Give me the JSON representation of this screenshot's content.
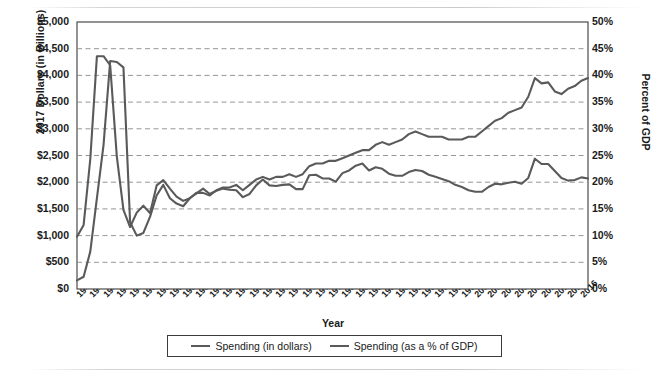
{
  "chart_data": {
    "type": "line",
    "title": "",
    "xlabel": "Year",
    "ylabel": "2017 Dollars (in Billions)",
    "y2label": "Percent of GDP",
    "grid": true,
    "legend_position": "bottom",
    "xlim": [
      1940,
      2017
    ],
    "ylim": [
      0,
      5000
    ],
    "y2lim": [
      0,
      50
    ],
    "x_tick_labels": [
      "1940",
      "1942",
      "1944",
      "1946",
      "1948",
      "1950",
      "1952",
      "1954",
      "1956",
      "1958",
      "1960",
      "1962",
      "1964",
      "1966",
      "1968",
      "1970",
      "1972",
      "1974",
      "1976",
      "1978",
      "1980",
      "1982",
      "1984",
      "1986",
      "1988",
      "1990",
      "1992",
      "1994",
      "1996",
      "1998",
      "2000",
      "2002",
      "2004",
      "2006",
      "2008",
      "2010",
      "2012",
      "2014",
      "2016"
    ],
    "y_tick_labels": [
      "$0",
      "$500",
      "$1,000",
      "$1,500",
      "$2,000",
      "$2,500",
      "$3,000",
      "$3,500",
      "$4,000",
      "$4,500",
      "$5,000"
    ],
    "y2_tick_labels": [
      "0%",
      "5%",
      "10%",
      "15%",
      "20%",
      "25%",
      "30%",
      "35%",
      "40%",
      "45%",
      "50%"
    ],
    "line_color": "#5a5a5a",
    "x": [
      1940,
      1941,
      1942,
      1943,
      1944,
      1945,
      1946,
      1947,
      1948,
      1949,
      1950,
      1951,
      1952,
      1953,
      1954,
      1955,
      1956,
      1957,
      1958,
      1959,
      1960,
      1961,
      1962,
      1963,
      1964,
      1965,
      1966,
      1967,
      1968,
      1969,
      1970,
      1971,
      1972,
      1973,
      1974,
      1975,
      1976,
      1977,
      1978,
      1979,
      1980,
      1981,
      1982,
      1983,
      1984,
      1985,
      1986,
      1987,
      1988,
      1989,
      1990,
      1991,
      1992,
      1993,
      1994,
      1995,
      1996,
      1997,
      1998,
      1999,
      2000,
      2001,
      2002,
      2003,
      2004,
      2005,
      2006,
      2007,
      2008,
      2009,
      2010,
      2011,
      2012,
      2013,
      2014,
      2015,
      2016,
      2017
    ],
    "series": [
      {
        "name": "Spending (in dollars)",
        "axis": "left",
        "unit": "billions of 2017 dollars",
        "values": [
          160,
          230,
          700,
          1700,
          2700,
          4270,
          4250,
          4150,
          1250,
          1000,
          1050,
          1350,
          1750,
          1950,
          1700,
          1600,
          1550,
          1700,
          1800,
          1800,
          1750,
          1850,
          1900,
          1900,
          1950,
          1850,
          1950,
          2050,
          2100,
          2050,
          2100,
          2100,
          2150,
          2100,
          2150,
          2300,
          2350,
          2350,
          2400,
          2400,
          2450,
          2500,
          2550,
          2600,
          2600,
          2700,
          2750,
          2700,
          2750,
          2800,
          2900,
          2950,
          2900,
          2850,
          2850,
          2850,
          2800,
          2800,
          2800,
          2850,
          2850,
          2950,
          3050,
          3150,
          3200,
          3300,
          3350,
          3400,
          3600,
          3950,
          3850,
          3870,
          3700,
          3650,
          3750,
          3800,
          3900,
          3950
        ]
      },
      {
        "name": "Spending (as a % of GDP)",
        "axis": "right",
        "unit": "percent of GDP",
        "values": [
          9.8,
          12.0,
          24.3,
          43.6,
          43.6,
          41.9,
          24.8,
          14.8,
          11.6,
          14.3,
          15.6,
          14.2,
          19.4,
          20.4,
          18.8,
          17.3,
          16.5,
          17.0,
          17.9,
          18.8,
          17.8,
          18.4,
          18.8,
          18.6,
          18.5,
          17.2,
          17.8,
          19.4,
          20.5,
          19.4,
          19.3,
          19.5,
          19.6,
          18.7,
          18.7,
          21.3,
          21.4,
          20.7,
          20.7,
          20.1,
          21.7,
          22.2,
          23.1,
          23.5,
          22.2,
          22.8,
          22.5,
          21.6,
          21.2,
          21.2,
          21.9,
          22.3,
          22.1,
          21.4,
          21.0,
          20.6,
          20.2,
          19.5,
          19.1,
          18.5,
          18.2,
          18.2,
          19.1,
          19.7,
          19.6,
          19.9,
          20.1,
          19.7,
          20.8,
          24.4,
          23.4,
          23.4,
          22.1,
          20.8,
          20.3,
          20.4,
          20.9,
          20.7
        ]
      }
    ]
  },
  "legend": {
    "items": [
      {
        "label": "Spending (in dollars)"
      },
      {
        "label": "Spending (as a % of GDP)"
      }
    ]
  }
}
